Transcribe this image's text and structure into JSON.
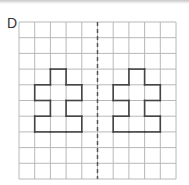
{
  "label": "D",
  "grid": {
    "cols": 10,
    "rows": 10,
    "x0": 19,
    "y0": 22,
    "cell": 15.7,
    "line_color": "#b8b8b8"
  },
  "mirror_line": {
    "type": "dashed",
    "column_boundary": 5,
    "color": "#555555"
  },
  "shapes": [
    {
      "name": "left-shape",
      "cells": [
        [
          3,
          2
        ],
        [
          4,
          1
        ],
        [
          4,
          2
        ],
        [
          4,
          3
        ],
        [
          5,
          2
        ],
        [
          6,
          1
        ],
        [
          6,
          2
        ],
        [
          6,
          3
        ]
      ]
    },
    {
      "name": "right-shape",
      "cells": [
        [
          3,
          7
        ],
        [
          4,
          6
        ],
        [
          4,
          7
        ],
        [
          4,
          8
        ],
        [
          5,
          7
        ],
        [
          6,
          6
        ],
        [
          6,
          7
        ],
        [
          6,
          8
        ]
      ]
    }
  ],
  "shape_color": "#444444"
}
